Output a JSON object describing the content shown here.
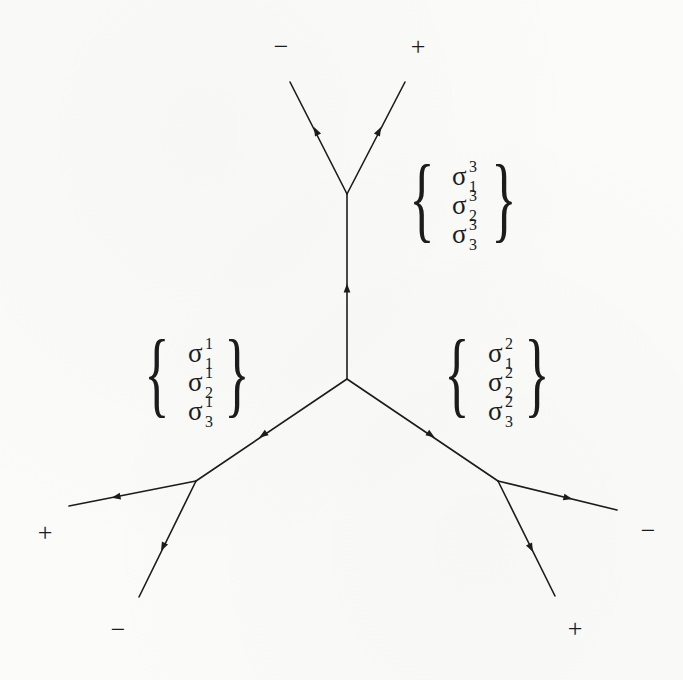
{
  "figure": {
    "type": "trivalent tree diagram with oriented edges",
    "background_color": "#fbfbf9",
    "ink_color": "#1c1c1c",
    "nodes": {
      "center": {
        "x": 347,
        "y": 379
      },
      "top": {
        "x": 347,
        "y": 194
      },
      "left": {
        "x": 196,
        "y": 481
      },
      "right": {
        "x": 498,
        "y": 481
      },
      "leaf_top_left": {
        "x": 290,
        "y": 82
      },
      "leaf_top_right": {
        "x": 405,
        "y": 82
      },
      "leaf_left_outer": {
        "x": 69,
        "y": 506
      },
      "leaf_left_lower": {
        "x": 139,
        "y": 597
      },
      "leaf_right_outer": {
        "x": 617,
        "y": 510
      },
      "leaf_right_lower": {
        "x": 555,
        "y": 596
      }
    },
    "edges": [
      {
        "name": "stem-up",
        "from": "center",
        "to": "top",
        "arrow": "up",
        "arrow_at": {
          "x": 347,
          "y": 288
        }
      },
      {
        "name": "diag-left",
        "from": "center",
        "to": "left",
        "arrow": "down-left",
        "arrow_at": {
          "x": 263,
          "y": 435
        }
      },
      {
        "name": "diag-right",
        "from": "center",
        "to": "right",
        "arrow": "down-right",
        "arrow_at": {
          "x": 431,
          "y": 435
        }
      },
      {
        "name": "top-left-branch",
        "from": "top",
        "to": "leaf_top_left",
        "arrow": "up-left",
        "arrow_at": {
          "x": 316,
          "y": 131
        }
      },
      {
        "name": "top-right-branch",
        "from": "top",
        "to": "leaf_top_right",
        "arrow": "up-right",
        "arrow_at": {
          "x": 379,
          "y": 131
        }
      },
      {
        "name": "left-outer-branch",
        "from": "left",
        "to": "leaf_left_outer",
        "arrow": "left",
        "arrow_at": {
          "x": 116,
          "y": 497
        }
      },
      {
        "name": "left-lower-branch",
        "from": "left",
        "to": "leaf_left_lower",
        "arrow": "down",
        "arrow_at": {
          "x": 163,
          "y": 547
        }
      },
      {
        "name": "right-outer-branch",
        "from": "right",
        "to": "leaf_right_outer",
        "arrow": "right",
        "arrow_at": {
          "x": 568,
          "y": 498
        }
      },
      {
        "name": "right-lower-branch",
        "from": "right",
        "to": "leaf_right_lower",
        "arrow": "down",
        "arrow_at": {
          "x": 531,
          "y": 548
        }
      }
    ],
    "signs": [
      {
        "id": "top-left",
        "label": "−",
        "x": 281,
        "y": 55
      },
      {
        "id": "top-right",
        "label": "+",
        "x": 418,
        "y": 55
      },
      {
        "id": "left-outer",
        "label": "+",
        "x": 45,
        "y": 541
      },
      {
        "id": "left-lower",
        "label": "−",
        "x": 118,
        "y": 638
      },
      {
        "id": "right-outer",
        "label": "−",
        "x": 648,
        "y": 539
      },
      {
        "id": "right-lower",
        "label": "+",
        "x": 575,
        "y": 637
      }
    ],
    "label_groups": [
      {
        "id": "top-group",
        "brace_open": "{",
        "brace_close": "}",
        "open_x": 422,
        "close_x": 504,
        "center_y": 198,
        "brace_size": 96,
        "items": [
          {
            "base": "σ",
            "sup": "3",
            "sub": "1",
            "x": 452,
            "y": 185
          },
          {
            "base": "σ",
            "sup": "3",
            "sub": "2",
            "x": 452,
            "y": 214
          },
          {
            "base": "σ",
            "sup": "3",
            "sub": "3",
            "x": 452,
            "y": 243
          }
        ]
      },
      {
        "id": "left-group",
        "brace_open": "{",
        "brace_close": "}",
        "open_x": 157,
        "close_x": 237,
        "center_y": 373,
        "brace_size": 96,
        "items": [
          {
            "base": "σ",
            "sup": "1",
            "sub": "1",
            "x": 188,
            "y": 362
          },
          {
            "base": "σ",
            "sup": "1",
            "sub": "2",
            "x": 188,
            "y": 391
          },
          {
            "base": "σ",
            "sup": "1",
            "sub": "3",
            "x": 188,
            "y": 420
          }
        ]
      },
      {
        "id": "right-group",
        "brace_open": "{",
        "brace_close": "}",
        "open_x": 457,
        "close_x": 537,
        "center_y": 373,
        "brace_size": 96,
        "items": [
          {
            "base": "σ",
            "sup": "2",
            "sub": "1",
            "x": 488,
            "y": 362
          },
          {
            "base": "σ",
            "sup": "2",
            "sub": "2",
            "x": 488,
            "y": 391
          },
          {
            "base": "σ",
            "sup": "2",
            "sub": "3",
            "x": 488,
            "y": 420
          }
        ]
      }
    ]
  }
}
